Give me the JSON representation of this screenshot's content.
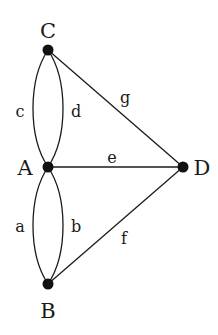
{
  "diagram": {
    "type": "multigraph",
    "vertices": [
      {
        "id": "C",
        "label": "C",
        "x": 48,
        "y": 50
      },
      {
        "id": "A",
        "label": "A",
        "x": 48,
        "y": 167
      },
      {
        "id": "D",
        "label": "D",
        "x": 183,
        "y": 167
      },
      {
        "id": "B",
        "label": "B",
        "x": 48,
        "y": 284
      }
    ],
    "edges": [
      {
        "id": "c",
        "label": "c",
        "from": "A",
        "to": "C"
      },
      {
        "id": "d",
        "label": "d",
        "from": "A",
        "to": "C"
      },
      {
        "id": "g",
        "label": "g",
        "from": "C",
        "to": "D"
      },
      {
        "id": "e",
        "label": "e",
        "from": "A",
        "to": "D"
      },
      {
        "id": "a",
        "label": "a",
        "from": "A",
        "to": "B"
      },
      {
        "id": "b",
        "label": "b",
        "from": "A",
        "to": "B"
      },
      {
        "id": "f",
        "label": "f",
        "from": "B",
        "to": "D"
      }
    ],
    "colors": {
      "stroke": "#1a1a1a",
      "node": "#111111",
      "background": "#ffffff"
    }
  }
}
